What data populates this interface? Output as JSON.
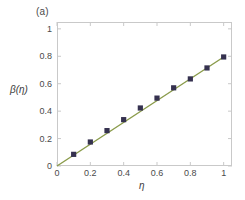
{
  "figure": {
    "panel_label": "(a)",
    "background_color": "#ffffff",
    "frame_color": "#c9c9c9"
  },
  "chart_data": {
    "type": "scatter",
    "title": "",
    "subtitle": "",
    "panel": "(a)",
    "xlabel": "η",
    "ylabel": "β(η)",
    "xlim": [
      0,
      1.05
    ],
    "ylim": [
      0,
      1.05
    ],
    "xticks": [
      0,
      0.2,
      0.4,
      0.6,
      0.8,
      1
    ],
    "xticklabels": [
      "0",
      "0.2",
      "0.4",
      "0.6",
      "0.8",
      "1"
    ],
    "yticks": [
      0,
      0.2,
      0.4,
      0.6,
      0.8,
      1
    ],
    "yticklabels": [
      "0",
      "0.2",
      "0.4",
      "0.6",
      "0.8",
      "1"
    ],
    "grid": false,
    "legend": false,
    "legend_position": "none",
    "series": [
      {
        "name": "data points",
        "style": "markers",
        "marker": "square",
        "color": "#35314f",
        "x": [
          0.1,
          0.2,
          0.3,
          0.4,
          0.5,
          0.6,
          0.7,
          0.8,
          0.9,
          1.0
        ],
        "y": [
          0.085,
          0.175,
          0.258,
          0.338,
          0.423,
          0.495,
          0.57,
          0.635,
          0.715,
          0.795
        ]
      },
      {
        "name": "fit line",
        "style": "line",
        "color": "#8a9b4a",
        "x": [
          0.0,
          1.0
        ],
        "y": [
          0.0,
          0.795
        ]
      }
    ]
  }
}
